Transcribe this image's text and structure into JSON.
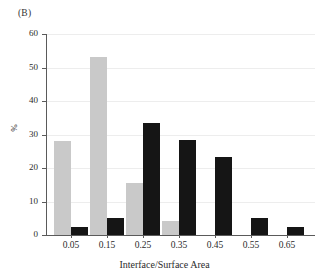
{
  "figure": {
    "panel_label": "(B)"
  },
  "chart_data": {
    "type": "bar",
    "title": "",
    "subtitle": "",
    "xlabel": "Interface/Surface Area",
    "ylabel": "%",
    "categories": [
      "0.05",
      "0.15",
      "0.25",
      "0.35",
      "0.45",
      "0.55",
      "0.65"
    ],
    "series": [
      {
        "name": "light-gray",
        "color": "#c9c9c9",
        "values": [
          28,
          53,
          15.5,
          4.2,
          0,
          0,
          0
        ]
      },
      {
        "name": "black",
        "color": "#151515",
        "values": [
          2.5,
          5.1,
          33.5,
          28.5,
          23.3,
          5.1,
          2.5
        ]
      }
    ],
    "ylim": [
      0,
      60
    ],
    "yticks": [
      0,
      10,
      20,
      30,
      40,
      50,
      60
    ],
    "ytick_labels": [
      "0",
      "10",
      "20",
      "30",
      "40",
      "50",
      "60"
    ],
    "grid": "faint-horizontal",
    "legend": "none",
    "legend_position": "none"
  },
  "axis": {
    "y_tick_labels": [
      "60",
      "50",
      "40",
      "30",
      "20",
      "10",
      "0"
    ],
    "x_tick_labels": [
      "0.05",
      "0.15",
      "0.25",
      "0.35",
      "0.45",
      "0.55",
      "0.65"
    ]
  }
}
